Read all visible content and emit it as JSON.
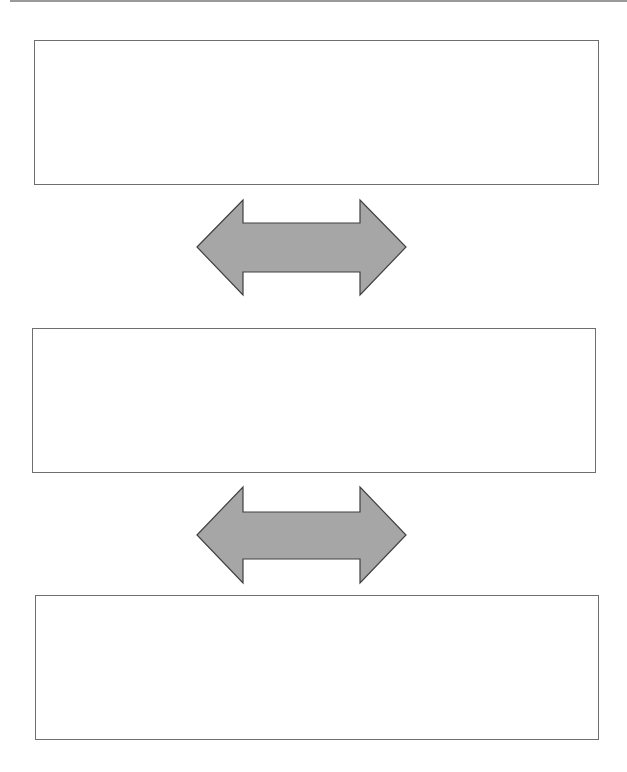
{
  "diagram": {
    "type": "vertical-flow",
    "boxes": [
      {
        "id": "box-1",
        "label": ""
      },
      {
        "id": "box-2",
        "label": ""
      },
      {
        "id": "box-3",
        "label": ""
      }
    ],
    "connectors": [
      {
        "from": "box-1",
        "to": "box-2",
        "shape": "double-headed-arrow"
      },
      {
        "from": "box-2",
        "to": "box-3",
        "shape": "double-headed-arrow"
      }
    ],
    "colors": {
      "arrow_fill": "#a6a6a6",
      "arrow_stroke": "#404040",
      "box_border": "#6e6e6e",
      "top_rule": "#9a9a9a"
    }
  }
}
